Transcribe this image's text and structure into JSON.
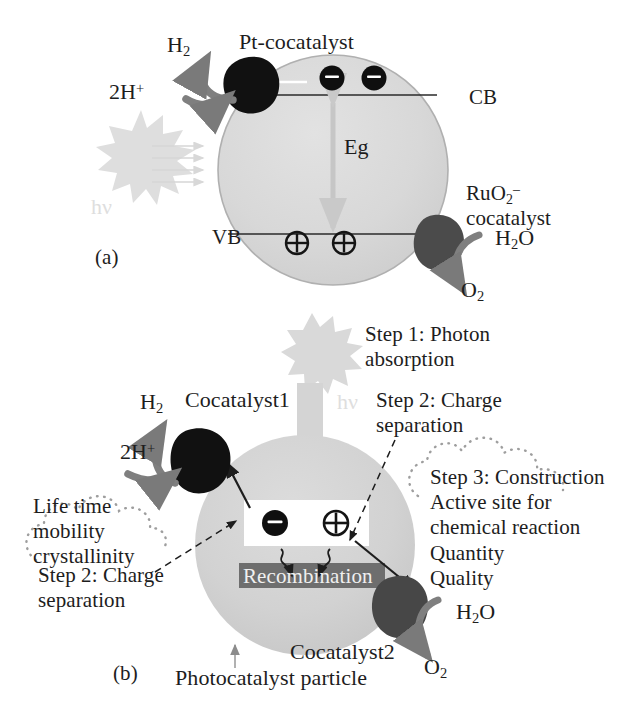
{
  "figure": {
    "background_color": "#ffffff"
  },
  "palette": {
    "particle_fill": "#d8d8d8",
    "particle_stroke": "#b4b4b4",
    "particle_fill_b": "#d2d2d2",
    "cocatalyst_dark": "#121212",
    "cocatalyst_gray": "#4e4e4e",
    "arrow_gray": "#7a7a7a",
    "photon_gray": "#dcdcdc",
    "recombination_bar": "#6e6e6e",
    "text": "#1d1d1d",
    "band_line": "#2a2a2a",
    "dotted_cloud": "#9a9a9a"
  },
  "panel_a": {
    "letter": "(a)",
    "labels": {
      "h2": "H",
      "h2_sub": "2",
      "two_h_plus": "2H",
      "two_h_plus_sup": "+",
      "pt_cocatalyst": "Pt-cocatalyst",
      "cb": "CB",
      "vb": "VB",
      "eg": "Eg",
      "hv": "hν",
      "ruo2_line1": "RuO",
      "ruo2_sub": "2",
      "ruo2_sup": "–",
      "ruo2_line2": "cocatalyst",
      "h2o": "H",
      "h2o_sub": "2",
      "h2o_rest": "O",
      "o2": "O",
      "o2_sub": "2"
    },
    "charges": {
      "electron_glyph": "⊖",
      "hole_glyph": "⊕",
      "electron_count": 2,
      "hole_count": 2
    },
    "light_arrow_count": 4
  },
  "panel_b": {
    "letter": "(b)",
    "labels": {
      "h2": "H",
      "h2_sub": "2",
      "two_h_plus": "2H",
      "two_h_plus_sup": "+",
      "cocatalyst1": "Cocatalyst1",
      "cocatalyst2": "Cocatalyst2",
      "hv": "hν",
      "step1": "Step 1: Photon\nabsorption",
      "step2_top": "Step 2: Charge\nseparation",
      "step2_bottom": "Step 2: Charge\nseparation",
      "step3": "Step 3: Construction\nActive site for\nchemical reaction\nQuantity\nQuality",
      "properties_cloud": "Life time\nmobility\ncrystallinity",
      "recombination": "Recombination",
      "photocatalyst_particle": "Photocatalyst particle",
      "particle_pointer_glyph": "↑",
      "h2o": "H",
      "h2o_sub": "2",
      "h2o_rest": "O",
      "o2": "O",
      "o2_sub": "2"
    },
    "charges": {
      "electron_glyph": "⊖",
      "hole_glyph": "⊕"
    }
  }
}
